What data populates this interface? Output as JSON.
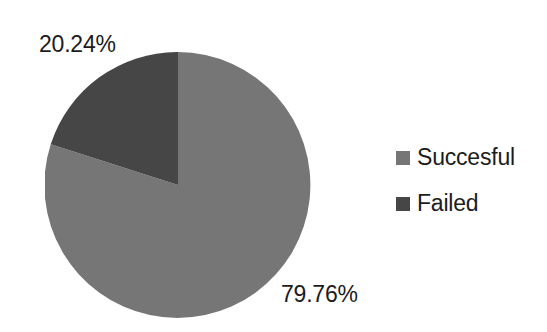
{
  "chart_data": {
    "type": "pie",
    "title": "",
    "labels": [
      "Succesful",
      "Failed"
    ],
    "values": [
      79.76,
      20.24
    ],
    "value_labels": [
      "79.76%",
      "20.24%"
    ],
    "colors": [
      "#767676",
      "#464646"
    ],
    "units": "percent",
    "legend_position": "right",
    "start_angle_deg": 90,
    "direction": "counterclockwise",
    "grid": false
  },
  "pie": {
    "center_x": 133,
    "center_y": 133,
    "radius": 133,
    "slices": [
      {
        "name": "Succesful",
        "percent_label": "79.76%",
        "color": "#767676",
        "path": "M 133 133 L 133 0 A 133 133 0 1 1 5.74 92.35 Z"
      },
      {
        "name": "Failed",
        "percent_label": "20.24%",
        "color": "#464646",
        "path": "M 133 133 L 5.74 92.35 A 133 133 0 0 1 133 0 Z"
      }
    ]
  },
  "labels": {
    "failed_percent": "20.24%",
    "successful_percent": "79.76%"
  },
  "legend": {
    "items": [
      {
        "label": "Succesful",
        "color": "#767676"
      },
      {
        "label": "Failed",
        "color": "#464646"
      }
    ]
  }
}
